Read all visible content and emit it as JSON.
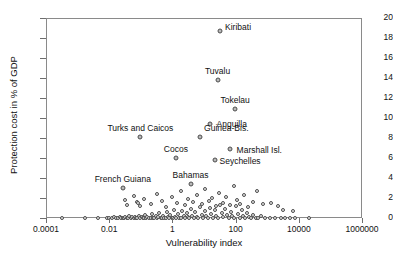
{
  "chart_data": {
    "type": "scatter",
    "title": "",
    "xlabel": "Vulnerability index",
    "ylabel": "Protection cost in % of GDP",
    "xscale": "log",
    "xlim": [
      0.0001,
      1000000
    ],
    "ylim": [
      0,
      20
    ],
    "xticks": [
      "0.0001",
      "0.01",
      "1",
      "100",
      "10000",
      "1000000"
    ],
    "yticks": [
      "0",
      "2",
      "4",
      "6",
      "8",
      "10",
      "12",
      "14",
      "16",
      "18",
      "20"
    ],
    "grid": false,
    "legend": "none",
    "marker": "open-grey-circle",
    "labeled_points": [
      {
        "name": "Kiribati",
        "x": 30,
        "y": 18.8,
        "label_dx": 5,
        "label_dy": -4
      },
      {
        "name": "Tuvalu",
        "x": 25,
        "y": 13.9,
        "label_dx": 0,
        "label_dy": -9
      },
      {
        "name": "Tokelau",
        "x": 90,
        "y": 11.0,
        "label_dx": 0,
        "label_dy": -9
      },
      {
        "name": "Anguilla",
        "x": 14,
        "y": 9.5,
        "label_dx": 7,
        "label_dy": 0
      },
      {
        "name": "Guinea-Bis.",
        "x": 7,
        "y": 8.2,
        "label_dx": 4,
        "label_dy": -9
      },
      {
        "name": "Turks and Caicos",
        "x": 0.09,
        "y": 8.2,
        "label_dx": 0,
        "label_dy": -9
      },
      {
        "name": "Marshall Isl.",
        "x": 60,
        "y": 7.0,
        "label_dx": 7,
        "label_dy": 1
      },
      {
        "name": "Seychelles",
        "x": 20,
        "y": 5.9,
        "label_dx": 5,
        "label_dy": 1
      },
      {
        "name": "Cocos",
        "x": 1.2,
        "y": 6.1,
        "label_dx": 0,
        "label_dy": -9
      },
      {
        "name": "Bahamas",
        "x": 3.5,
        "y": 3.5,
        "label_dx": 0,
        "label_dy": -9
      },
      {
        "name": "French Guiana",
        "x": 0.025,
        "y": 3.1,
        "label_dx": 0,
        "label_dy": -9
      }
    ],
    "points": [
      {
        "x": 0.0003,
        "y": 0.1
      },
      {
        "x": 0.0016,
        "y": 0.1
      },
      {
        "x": 0.004,
        "y": 0.12
      },
      {
        "x": 0.008,
        "y": 0.1
      },
      {
        "x": 0.009,
        "y": 0.15
      },
      {
        "x": 0.011,
        "y": 0.1
      },
      {
        "x": 0.013,
        "y": 0.2
      },
      {
        "x": 0.015,
        "y": 0.12
      },
      {
        "x": 0.018,
        "y": 0.1
      },
      {
        "x": 0.02,
        "y": 0.25
      },
      {
        "x": 0.022,
        "y": 0.1
      },
      {
        "x": 0.025,
        "y": 0.15
      },
      {
        "x": 0.028,
        "y": 0.1
      },
      {
        "x": 0.03,
        "y": 0.2
      },
      {
        "x": 0.033,
        "y": 0.12
      },
      {
        "x": 0.037,
        "y": 0.1
      },
      {
        "x": 0.04,
        "y": 0.3
      },
      {
        "x": 0.045,
        "y": 0.1
      },
      {
        "x": 0.05,
        "y": 0.18
      },
      {
        "x": 0.055,
        "y": 0.1
      },
      {
        "x": 0.06,
        "y": 0.25
      },
      {
        "x": 0.065,
        "y": 0.12
      },
      {
        "x": 0.07,
        "y": 0.1
      },
      {
        "x": 0.08,
        "y": 0.35
      },
      {
        "x": 0.09,
        "y": 0.1
      },
      {
        "x": 0.1,
        "y": 0.2
      },
      {
        "x": 0.11,
        "y": 0.15
      },
      {
        "x": 0.12,
        "y": 0.1
      },
      {
        "x": 0.13,
        "y": 0.4
      },
      {
        "x": 0.14,
        "y": 0.1
      },
      {
        "x": 0.15,
        "y": 0.25
      },
      {
        "x": 0.17,
        "y": 0.12
      },
      {
        "x": 0.19,
        "y": 0.1
      },
      {
        "x": 0.21,
        "y": 0.5
      },
      {
        "x": 0.23,
        "y": 0.15
      },
      {
        "x": 0.25,
        "y": 0.1
      },
      {
        "x": 0.28,
        "y": 0.3
      },
      {
        "x": 0.3,
        "y": 0.1
      },
      {
        "x": 0.33,
        "y": 0.2
      },
      {
        "x": 0.36,
        "y": 0.6
      },
      {
        "x": 0.4,
        "y": 0.12
      },
      {
        "x": 0.44,
        "y": 0.1
      },
      {
        "x": 0.48,
        "y": 0.35
      },
      {
        "x": 0.52,
        "y": 0.15
      },
      {
        "x": 0.57,
        "y": 0.1
      },
      {
        "x": 0.62,
        "y": 0.7
      },
      {
        "x": 0.68,
        "y": 0.2
      },
      {
        "x": 0.74,
        "y": 0.1
      },
      {
        "x": 0.8,
        "y": 0.45
      },
      {
        "x": 0.88,
        "y": 0.12
      },
      {
        "x": 0.95,
        "y": 0.1
      },
      {
        "x": 1.05,
        "y": 0.9
      },
      {
        "x": 1.15,
        "y": 0.25
      },
      {
        "x": 1.25,
        "y": 0.1
      },
      {
        "x": 1.4,
        "y": 0.55
      },
      {
        "x": 1.5,
        "y": 0.15
      },
      {
        "x": 1.7,
        "y": 0.1
      },
      {
        "x": 1.9,
        "y": 0.8
      },
      {
        "x": 2.1,
        "y": 0.3
      },
      {
        "x": 2.3,
        "y": 0.1
      },
      {
        "x": 2.6,
        "y": 0.6
      },
      {
        "x": 2.9,
        "y": 0.2
      },
      {
        "x": 3.2,
        "y": 0.1
      },
      {
        "x": 3.6,
        "y": 1.0
      },
      {
        "x": 4.0,
        "y": 0.35
      },
      {
        "x": 4.5,
        "y": 0.1
      },
      {
        "x": 5.0,
        "y": 0.7
      },
      {
        "x": 5.6,
        "y": 0.25
      },
      {
        "x": 6.2,
        "y": 0.12
      },
      {
        "x": 7.0,
        "y": 1.2
      },
      {
        "x": 7.8,
        "y": 0.4
      },
      {
        "x": 8.7,
        "y": 0.1
      },
      {
        "x": 9.7,
        "y": 0.8
      },
      {
        "x": 11,
        "y": 0.3
      },
      {
        "x": 12,
        "y": 0.15
      },
      {
        "x": 14,
        "y": 1.1
      },
      {
        "x": 16,
        "y": 0.5
      },
      {
        "x": 18,
        "y": 0.1
      },
      {
        "x": 20,
        "y": 0.9
      },
      {
        "x": 23,
        "y": 0.35
      },
      {
        "x": 26,
        "y": 0.12
      },
      {
        "x": 30,
        "y": 1.4
      },
      {
        "x": 34,
        "y": 0.6
      },
      {
        "x": 38,
        "y": 0.2
      },
      {
        "x": 44,
        "y": 1.0
      },
      {
        "x": 50,
        "y": 0.4
      },
      {
        "x": 57,
        "y": 0.1
      },
      {
        "x": 65,
        "y": 0.75
      },
      {
        "x": 74,
        "y": 0.3
      },
      {
        "x": 85,
        "y": 0.15
      },
      {
        "x": 97,
        "y": 1.3
      },
      {
        "x": 110,
        "y": 0.5
      },
      {
        "x": 125,
        "y": 0.1
      },
      {
        "x": 145,
        "y": 0.9
      },
      {
        "x": 165,
        "y": 0.35
      },
      {
        "x": 190,
        "y": 0.12
      },
      {
        "x": 220,
        "y": 0.6
      },
      {
        "x": 250,
        "y": 0.2
      },
      {
        "x": 290,
        "y": 0.1
      },
      {
        "x": 340,
        "y": 0.45
      },
      {
        "x": 400,
        "y": 0.15
      },
      {
        "x": 480,
        "y": 0.1
      },
      {
        "x": 600,
        "y": 0.3
      },
      {
        "x": 800,
        "y": 0.1
      },
      {
        "x": 1100,
        "y": 0.12
      },
      {
        "x": 1600,
        "y": 0.1
      },
      {
        "x": 2500,
        "y": 0.1
      },
      {
        "x": 3400,
        "y": 0.1
      },
      {
        "x": 5000,
        "y": 0.1
      },
      {
        "x": 7000,
        "y": 0.12
      },
      {
        "x": 20000,
        "y": 0.1
      },
      {
        "x": 0.03,
        "y": 1.9
      },
      {
        "x": 0.035,
        "y": 1.4
      },
      {
        "x": 0.055,
        "y": 2.3
      },
      {
        "x": 0.07,
        "y": 1.7
      },
      {
        "x": 0.075,
        "y": 1.6
      },
      {
        "x": 0.09,
        "y": 1.3
      },
      {
        "x": 0.12,
        "y": 2.0
      },
      {
        "x": 0.2,
        "y": 1.5
      },
      {
        "x": 0.3,
        "y": 2.5
      },
      {
        "x": 0.45,
        "y": 1.8
      },
      {
        "x": 0.6,
        "y": 1.2
      },
      {
        "x": 0.9,
        "y": 2.2
      },
      {
        "x": 1.3,
        "y": 1.6
      },
      {
        "x": 1.8,
        "y": 2.8
      },
      {
        "x": 2.4,
        "y": 1.4
      },
      {
        "x": 3.0,
        "y": 2.0
      },
      {
        "x": 4.2,
        "y": 1.7
      },
      {
        "x": 5.5,
        "y": 2.4
      },
      {
        "x": 8,
        "y": 1.5
      },
      {
        "x": 10,
        "y": 3.0
      },
      {
        "x": 13,
        "y": 1.8
      },
      {
        "x": 17,
        "y": 2.1
      },
      {
        "x": 22,
        "y": 1.3
      },
      {
        "x": 28,
        "y": 2.6
      },
      {
        "x": 36,
        "y": 1.6
      },
      {
        "x": 46,
        "y": 2.2
      },
      {
        "x": 60,
        "y": 1.4
      },
      {
        "x": 80,
        "y": 3.3
      },
      {
        "x": 100,
        "y": 1.9
      },
      {
        "x": 130,
        "y": 1.5
      },
      {
        "x": 170,
        "y": 2.4
      },
      {
        "x": 230,
        "y": 1.2
      },
      {
        "x": 320,
        "y": 1.7
      },
      {
        "x": 450,
        "y": 2.8
      },
      {
        "x": 700,
        "y": 1.5
      },
      {
        "x": 1200,
        "y": 1.6
      },
      {
        "x": 2000,
        "y": 1.3
      },
      {
        "x": 3000,
        "y": 0.9
      },
      {
        "x": 6000,
        "y": 0.8
      }
    ]
  }
}
